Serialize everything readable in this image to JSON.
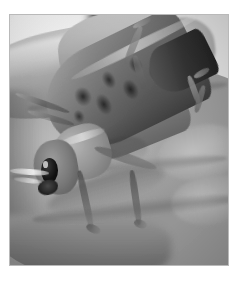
{
  "page": {
    "background_color": "#ffffff",
    "width": 240,
    "height": 284
  },
  "photo": {
    "alt_text": "Large grasshopper resting on an open human palm",
    "border_color": "#b9b9b9",
    "frame": {
      "x": 9,
      "y": 14,
      "width": 220,
      "height": 252
    },
    "color_mode": "black-and-white",
    "subjects": [
      {
        "name": "human-hand",
        "description": "Open palm with thumb at upper left and fingers curving across the frame"
      },
      {
        "name": "grasshopper",
        "description": "Large locust/grasshopper with mottled spotted forewing angled up to the right"
      },
      {
        "name": "background",
        "description": "Bright blurred outdoor background with a dark vertical post at top center"
      }
    ],
    "insect_parts": [
      "head",
      "compound-eye",
      "mandible",
      "antenna",
      "pronotum",
      "forewing",
      "hindwing",
      "foreleg",
      "midleg",
      "hindleg"
    ]
  }
}
